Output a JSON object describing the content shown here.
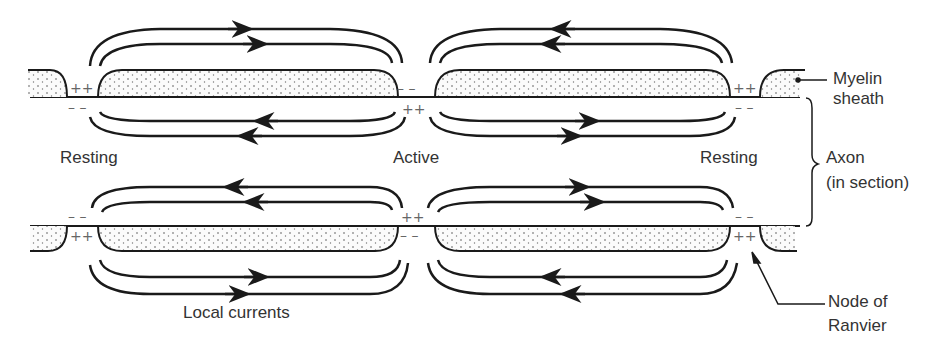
{
  "figure": {
    "colors": {
      "line": "#1a1a1a",
      "text": "#333333",
      "sign": "#666666",
      "myelin_dot": "#555555"
    }
  },
  "labels": {
    "resting_left": "Resting",
    "active": "Active",
    "resting_right": "Resting",
    "myelin_line1": "Myelin",
    "myelin_line2": "sheath",
    "axon_line1": "Axon",
    "axon_line2": "(in section)",
    "node_line1": "Node of",
    "node_line2": "Ranvier",
    "local_currents": "Local currents"
  },
  "charges": {
    "top_outside": [
      "++",
      "– –",
      "++"
    ],
    "top_inside": [
      "– –",
      "++",
      "– –"
    ],
    "bottom_inside": [
      "– –",
      "++",
      "– –"
    ],
    "bottom_outside": [
      "++",
      "– –",
      "++"
    ]
  },
  "current_loops": {
    "top_outside_direction": [
      "right",
      "left"
    ],
    "top_inside_direction": [
      "left",
      "right"
    ],
    "bottom_inside_direction": [
      "left",
      "right"
    ],
    "bottom_outside_direction": [
      "right",
      "left"
    ]
  }
}
